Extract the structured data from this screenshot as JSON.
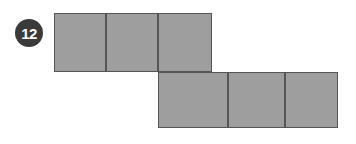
{
  "canvas": {
    "width": 356,
    "height": 144,
    "background": "#ffffff"
  },
  "badge": {
    "label": "12",
    "shape": "circle",
    "fill": "#3a3a3a",
    "text_color": "#ffffff",
    "cx": 29,
    "cy": 33,
    "r": 14,
    "font_size": 15
  },
  "figure": {
    "name": "hexomino-net",
    "cell_fill": "#9e9e9e",
    "cell_stroke": "#555555",
    "stroke_width": 1,
    "cell_width": 52,
    "cell_height": 59,
    "rows": [
      {
        "name": "top-row",
        "y": 13,
        "height": 59,
        "cells": [
          {
            "name": "cell-top-1",
            "x": 54,
            "y": 13,
            "w": 52,
            "h": 59
          },
          {
            "name": "cell-top-2",
            "x": 106,
            "y": 13,
            "w": 52,
            "h": 59
          },
          {
            "name": "cell-top-3",
            "x": 158,
            "y": 13,
            "w": 54,
            "h": 59
          }
        ]
      },
      {
        "name": "bottom-row",
        "y": 72,
        "height": 56,
        "cells": [
          {
            "name": "cell-bottom-1",
            "x": 158,
            "y": 72,
            "w": 70,
            "h": 56
          },
          {
            "name": "cell-bottom-2",
            "x": 228,
            "y": 72,
            "w": 57,
            "h": 56
          },
          {
            "name": "cell-bottom-3",
            "x": 285,
            "y": 72,
            "w": 53,
            "h": 56
          }
        ]
      }
    ]
  }
}
